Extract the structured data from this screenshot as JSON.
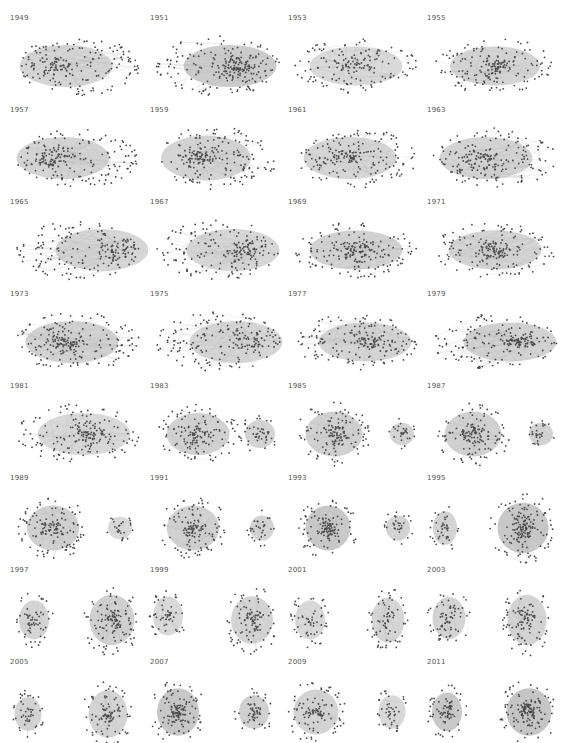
{
  "figure": {
    "columns": 4,
    "rows": 8,
    "node_color": "#4a4a4a",
    "edge_color": "#b8b8b8",
    "background": "#ffffff"
  },
  "panels": [
    {
      "year": "1949",
      "layout": "one",
      "clusters": [
        {
          "cx": 70,
          "cy": 52,
          "rx": 62,
          "ry": 30,
          "density": 0.55,
          "core_dx": -20
        }
      ]
    },
    {
      "year": "1951",
      "layout": "one",
      "clusters": [
        {
          "cx": 70,
          "cy": 52,
          "rx": 62,
          "ry": 30,
          "density": 0.8,
          "core_dx": 20
        }
      ]
    },
    {
      "year": "1953",
      "layout": "one",
      "clusters": [
        {
          "cx": 70,
          "cy": 52,
          "rx": 62,
          "ry": 28,
          "density": 0.45,
          "core_dx": 0
        }
      ]
    },
    {
      "year": "1955",
      "layout": "one",
      "clusters": [
        {
          "cx": 70,
          "cy": 52,
          "rx": 60,
          "ry": 28,
          "density": 0.6,
          "core_dx": 0
        }
      ]
    },
    {
      "year": "1957",
      "layout": "one",
      "clusters": [
        {
          "cx": 70,
          "cy": 52,
          "rx": 62,
          "ry": 30,
          "density": 0.6,
          "core_dx": -25
        }
      ]
    },
    {
      "year": "1959",
      "layout": "one",
      "clusters": [
        {
          "cx": 70,
          "cy": 52,
          "rx": 60,
          "ry": 32,
          "density": 0.6,
          "core_dx": -20
        }
      ]
    },
    {
      "year": "1961",
      "layout": "one",
      "clusters": [
        {
          "cx": 70,
          "cy": 52,
          "rx": 62,
          "ry": 30,
          "density": 0.55,
          "core_dx": -10
        }
      ]
    },
    {
      "year": "1963",
      "layout": "one",
      "clusters": [
        {
          "cx": 70,
          "cy": 52,
          "rx": 62,
          "ry": 30,
          "density": 0.6,
          "core_dx": -15
        }
      ]
    },
    {
      "year": "1965",
      "layout": "one",
      "clusters": [
        {
          "cx": 70,
          "cy": 52,
          "rx": 62,
          "ry": 30,
          "density": 0.55,
          "core_dx": 40
        }
      ]
    },
    {
      "year": "1967",
      "layout": "one",
      "clusters": [
        {
          "cx": 70,
          "cy": 52,
          "rx": 62,
          "ry": 30,
          "density": 0.55,
          "core_dx": 25
        }
      ]
    },
    {
      "year": "1969",
      "layout": "one",
      "clusters": [
        {
          "cx": 70,
          "cy": 52,
          "rx": 62,
          "ry": 28,
          "density": 0.65,
          "core_dx": 0
        }
      ]
    },
    {
      "year": "1971",
      "layout": "one",
      "clusters": [
        {
          "cx": 70,
          "cy": 52,
          "rx": 62,
          "ry": 28,
          "density": 0.6,
          "core_dx": 0
        }
      ]
    },
    {
      "year": "1973",
      "layout": "one",
      "clusters": [
        {
          "cx": 70,
          "cy": 52,
          "rx": 62,
          "ry": 30,
          "density": 0.65,
          "core_dx": -10
        }
      ]
    },
    {
      "year": "1975",
      "layout": "one",
      "clusters": [
        {
          "cx": 70,
          "cy": 52,
          "rx": 62,
          "ry": 30,
          "density": 0.55,
          "core_dx": 30
        }
      ]
    },
    {
      "year": "1977",
      "layout": "one",
      "clusters": [
        {
          "cx": 70,
          "cy": 52,
          "rx": 62,
          "ry": 28,
          "density": 0.6,
          "core_dx": 15
        }
      ]
    },
    {
      "year": "1979",
      "layout": "one",
      "clusters": [
        {
          "cx": 70,
          "cy": 52,
          "rx": 62,
          "ry": 28,
          "density": 0.65,
          "core_dx": 25
        }
      ]
    },
    {
      "year": "1981",
      "layout": "one",
      "clusters": [
        {
          "cx": 70,
          "cy": 52,
          "rx": 62,
          "ry": 30,
          "density": 0.5,
          "core_dx": 10
        }
      ]
    },
    {
      "year": "1983",
      "layout": "two",
      "clusters": [
        {
          "cx": 50,
          "cy": 52,
          "rx": 42,
          "ry": 30,
          "density": 0.65,
          "core_dx": 0
        },
        {
          "cx": 112,
          "cy": 52,
          "rx": 20,
          "ry": 20,
          "density": 0.6,
          "core_dx": 0
        }
      ]
    },
    {
      "year": "1985",
      "layout": "two",
      "clusters": [
        {
          "cx": 48,
          "cy": 52,
          "rx": 38,
          "ry": 32,
          "density": 0.7,
          "core_dx": 0
        },
        {
          "cx": 116,
          "cy": 52,
          "rx": 16,
          "ry": 16,
          "density": 0.6,
          "core_dx": 0
        }
      ]
    },
    {
      "year": "1987",
      "layout": "two",
      "clusters": [
        {
          "cx": 48,
          "cy": 52,
          "rx": 38,
          "ry": 32,
          "density": 0.7,
          "core_dx": 0
        },
        {
          "cx": 116,
          "cy": 52,
          "rx": 16,
          "ry": 16,
          "density": 0.6,
          "core_dx": 0
        }
      ]
    },
    {
      "year": "1989",
      "layout": "two",
      "clusters": [
        {
          "cx": 45,
          "cy": 54,
          "rx": 35,
          "ry": 32,
          "density": 0.7,
          "core_dx": 0
        },
        {
          "cx": 112,
          "cy": 54,
          "rx": 16,
          "ry": 16,
          "density": 0.5,
          "core_dx": 0
        }
      ]
    },
    {
      "year": "1991",
      "layout": "two",
      "clusters": [
        {
          "cx": 45,
          "cy": 54,
          "rx": 35,
          "ry": 32,
          "density": 0.7,
          "core_dx": 0
        },
        {
          "cx": 114,
          "cy": 54,
          "rx": 16,
          "ry": 18,
          "density": 0.6,
          "core_dx": 0
        }
      ]
    },
    {
      "year": "1993",
      "layout": "two",
      "clusters": [
        {
          "cx": 42,
          "cy": 54,
          "rx": 30,
          "ry": 32,
          "density": 0.85,
          "core_dx": 0
        },
        {
          "cx": 112,
          "cy": 54,
          "rx": 16,
          "ry": 18,
          "density": 0.6,
          "core_dx": 0
        }
      ]
    },
    {
      "year": "1995",
      "layout": "two",
      "clusters": [
        {
          "cx": 20,
          "cy": 54,
          "rx": 16,
          "ry": 24,
          "density": 0.6,
          "core_dx": 0
        },
        {
          "cx": 98,
          "cy": 54,
          "rx": 34,
          "ry": 36,
          "density": 0.9,
          "core_dx": 0
        }
      ]
    },
    {
      "year": "1997",
      "layout": "two",
      "clusters": [
        {
          "cx": 26,
          "cy": 54,
          "rx": 20,
          "ry": 28,
          "density": 0.6,
          "core_dx": 0
        },
        {
          "cx": 104,
          "cy": 54,
          "rx": 30,
          "ry": 36,
          "density": 0.7,
          "core_dx": 0
        }
      ]
    },
    {
      "year": "1999",
      "layout": "two",
      "clusters": [
        {
          "cx": 20,
          "cy": 50,
          "rx": 20,
          "ry": 28,
          "density": 0.5,
          "core_dx": 0
        },
        {
          "cx": 104,
          "cy": 54,
          "rx": 28,
          "ry": 34,
          "density": 0.6,
          "core_dx": 0
        }
      ]
    },
    {
      "year": "2001",
      "layout": "two",
      "clusters": [
        {
          "cx": 24,
          "cy": 54,
          "rx": 20,
          "ry": 28,
          "density": 0.5,
          "core_dx": 0
        },
        {
          "cx": 102,
          "cy": 54,
          "rx": 22,
          "ry": 32,
          "density": 0.55,
          "core_dx": 0
        }
      ]
    },
    {
      "year": "2003",
      "layout": "two",
      "clusters": [
        {
          "cx": 24,
          "cy": 52,
          "rx": 22,
          "ry": 30,
          "density": 0.6,
          "core_dx": 0
        },
        {
          "cx": 102,
          "cy": 54,
          "rx": 26,
          "ry": 36,
          "density": 0.6,
          "core_dx": 0
        }
      ]
    },
    {
      "year": "2005",
      "layout": "two",
      "clusters": [
        {
          "cx": 20,
          "cy": 56,
          "rx": 18,
          "ry": 24,
          "density": 0.6,
          "core_dx": 0
        },
        {
          "cx": 100,
          "cy": 56,
          "rx": 26,
          "ry": 34,
          "density": 0.6,
          "core_dx": 0
        }
      ]
    },
    {
      "year": "2007",
      "layout": "two",
      "clusters": [
        {
          "cx": 30,
          "cy": 54,
          "rx": 28,
          "ry": 34,
          "density": 0.9,
          "core_dx": 0
        },
        {
          "cx": 106,
          "cy": 54,
          "rx": 20,
          "ry": 24,
          "density": 0.7,
          "core_dx": 0
        }
      ]
    },
    {
      "year": "2009",
      "layout": "two",
      "clusters": [
        {
          "cx": 30,
          "cy": 54,
          "rx": 30,
          "ry": 32,
          "density": 0.6,
          "core_dx": 0
        },
        {
          "cx": 106,
          "cy": 54,
          "rx": 18,
          "ry": 24,
          "density": 0.5,
          "core_dx": 0
        }
      ]
    },
    {
      "year": "2011",
      "layout": "two",
      "clusters": [
        {
          "cx": 22,
          "cy": 54,
          "rx": 20,
          "ry": 28,
          "density": 0.85,
          "core_dx": 0
        },
        {
          "cx": 104,
          "cy": 54,
          "rx": 30,
          "ry": 34,
          "density": 0.95,
          "core_dx": 0
        }
      ]
    }
  ]
}
